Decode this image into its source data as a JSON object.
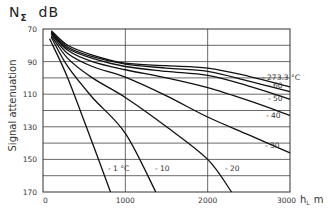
{
  "chart_data": {
    "type": "line",
    "title_main": "N",
    "title_sub": "Σ",
    "title_unit": "dB",
    "xlabel": "h_L m",
    "xlabel_main": "h",
    "xlabel_sub": "L",
    "xlabel_unit": "m",
    "ylabel": "Signal attenuation",
    "xlim": [
      0,
      3000
    ],
    "ylim": [
      170,
      70
    ],
    "y_inverted": true,
    "grid": true,
    "x_ticks": [
      0,
      1000,
      2000,
      3000
    ],
    "x_tick_labels": [
      "0",
      "1000",
      "2000",
      "3000"
    ],
    "y_ticks": [
      70,
      90,
      110,
      130,
      150,
      170
    ],
    "y_tick_labels": [
      "70",
      "90",
      "110",
      "130",
      "150",
      "170"
    ],
    "y_gridlines": [
      80,
      90,
      100,
      110,
      120,
      130,
      140,
      150,
      160
    ],
    "series": [
      {
        "name": "-273.3 °C",
        "label": "- 273.3 °C",
        "x": [
          100,
          300,
          600,
          1000,
          1500,
          2000,
          2500,
          3000
        ],
        "values": [
          71,
          80,
          86,
          91,
          92.5,
          94,
          99,
          105.5
        ]
      },
      {
        "name": "-60",
        "label": "- 60",
        "x": [
          100,
          300,
          600,
          1000,
          1500,
          2000,
          2500,
          3000
        ],
        "values": [
          71.5,
          81,
          87,
          91.5,
          94,
          96,
          102,
          108.5
        ]
      },
      {
        "name": "-50",
        "label": "- 50",
        "x": [
          100,
          300,
          600,
          1000,
          1500,
          2000,
          2500,
          3000
        ],
        "values": [
          72,
          82,
          88,
          93,
          96,
          98.5,
          105,
          113
        ]
      },
      {
        "name": "-40",
        "label": "- 40",
        "x": [
          100,
          300,
          600,
          1000,
          1500,
          2000,
          2500,
          3000
        ],
        "values": [
          72.5,
          83,
          90,
          95,
          100,
          106,
          114,
          123
        ]
      },
      {
        "name": "-30",
        "label": "- 30",
        "x": [
          100,
          300,
          600,
          1000,
          1500,
          2000,
          2500,
          3000
        ],
        "values": [
          73,
          85,
          93,
          99.5,
          111,
          124,
          135,
          146
        ]
      },
      {
        "name": "-20",
        "label": "- 20",
        "x": [
          100,
          300,
          600,
          1000,
          1500,
          2000,
          2290
        ],
        "values": [
          74,
          88,
          100,
          112,
          130,
          150,
          170
        ]
      },
      {
        "name": "-10",
        "label": "- 10",
        "x": [
          100,
          300,
          600,
          1000,
          1370
        ],
        "values": [
          75,
          93,
          112,
          134,
          170
        ]
      },
      {
        "name": "-1 °C",
        "label": "- 1 °C",
        "x": [
          80,
          300,
          600,
          820
        ],
        "values": [
          76,
          100,
          140,
          170
        ]
      }
    ],
    "annotations": [
      "- 273.3 °C",
      "- 60",
      "- 50",
      "- 40",
      "- 30",
      "- 20",
      "- 10",
      "- 1 °C"
    ]
  }
}
